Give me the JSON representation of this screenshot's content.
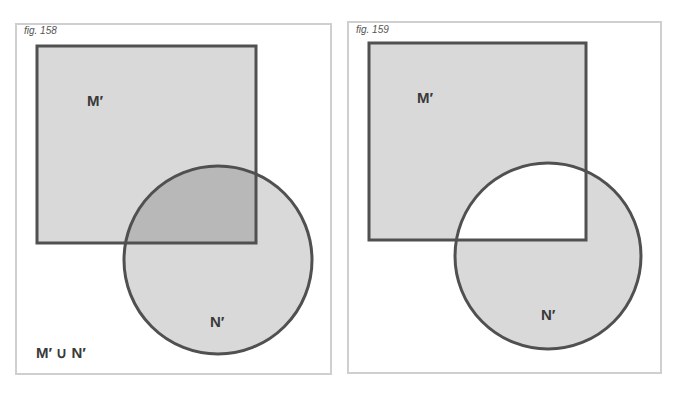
{
  "figures": [
    {
      "id": "fig158",
      "label": "fig. 158",
      "set_m_label": "M′",
      "set_n_label": "N′",
      "caption": "M′ ∪ N′",
      "description": "Union of M′ (square) and N′ (circle); overlap shaded darker"
    },
    {
      "id": "fig159",
      "label": "fig. 159",
      "set_m_label": "M′",
      "set_n_label": "N′",
      "caption": "",
      "description": "M′ and N′ shaded with intersection left white (symmetric difference)"
    }
  ],
  "colors": {
    "light_fill": "#d9d9d9",
    "overlap_fill": "#b8b8b8",
    "stroke": "#505050",
    "border": "#cfcfcf",
    "background": "#ffffff"
  }
}
